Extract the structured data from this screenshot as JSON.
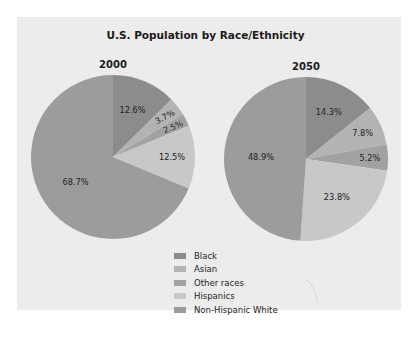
{
  "chart_data": [
    {
      "type": "pie",
      "title": "U.S. Population by Race/Ethnicity",
      "subtitle": "2000",
      "categories": [
        "Black",
        "Asian",
        "Other races",
        "Hispanics",
        "Non-Hispanic White"
      ],
      "values": [
        12.6,
        3.7,
        2.5,
        12.5,
        68.7
      ],
      "labels": [
        "12.6%",
        "3.7%",
        "2.5%",
        "12.5%",
        "68.7%"
      ],
      "colors": [
        "#8c8c8c",
        "#b3b3b3",
        "#a2a2a2",
        "#c8c8c8",
        "#9c9c9c"
      ]
    },
    {
      "type": "pie",
      "title": "U.S. Population by Race/Ethnicity",
      "subtitle": "2050",
      "categories": [
        "Black",
        "Asian",
        "Other races",
        "Hispanics",
        "Non-Hispanic White"
      ],
      "values": [
        14.3,
        7.8,
        5.2,
        23.8,
        48.9
      ],
      "labels": [
        "14.3%",
        "7.8%",
        "5.2%",
        "23.8%",
        "48.9%"
      ],
      "colors": [
        "#8c8c8c",
        "#b3b3b3",
        "#a2a2a2",
        "#c8c8c8",
        "#9c9c9c"
      ]
    }
  ],
  "chart": {
    "title": "U.S. Population by Race/Ethnicity",
    "pies": [
      {
        "year": "2000",
        "cx": 113,
        "cy": 157,
        "r": 82
      },
      {
        "year": "2050",
        "cx": 306,
        "cy": 159,
        "r": 82
      }
    ],
    "legend": [
      {
        "label": "Black",
        "color": "#8c8c8c"
      },
      {
        "label": "Asian",
        "color": "#b3b3b3"
      },
      {
        "label": "Other races",
        "color": "#a2a2a2"
      },
      {
        "label": "Hispanics",
        "color": "#c8c8c8"
      },
      {
        "label": "Non-Hispanic White",
        "color": "#9c9c9c"
      }
    ]
  }
}
